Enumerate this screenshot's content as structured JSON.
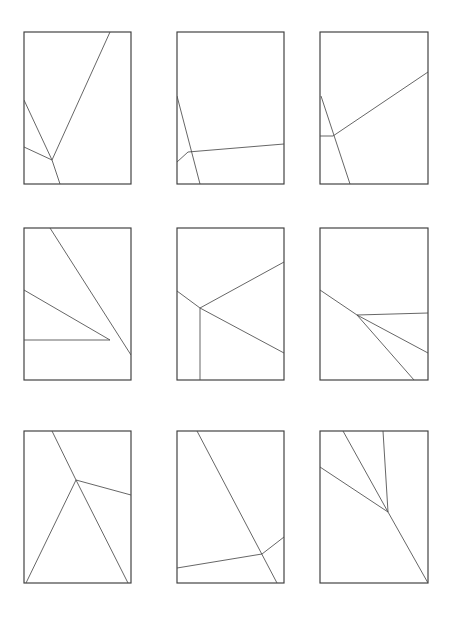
{
  "figure": {
    "canvas": {
      "width": 452,
      "height": 624,
      "background": "#ffffff"
    },
    "style": {
      "frame_color": "#3c3c3c",
      "frame_width": 1.15,
      "line_color": "#4a4a4a",
      "line_width": 0.85
    },
    "grid": {
      "rows": 3,
      "columns": 9
    }
  },
  "chart_data": {
    "type": "diagram",
    "subtitle": "",
    "xlabel": "",
    "ylabel": "",
    "grid": false,
    "legend": "none",
    "panel_count": 9,
    "panels": [
      {
        "id": "panel-1",
        "row": 1,
        "col": 1,
        "frame": {
          "x": 24,
          "y": 32,
          "width": 107,
          "height": 152
        },
        "segments": [
          {
            "name": "seg-1-a",
            "x1": 24,
            "y1": 100,
            "x2": 52,
            "y2": 160
          },
          {
            "name": "seg-1-b",
            "x1": 52,
            "y1": 160,
            "x2": 110,
            "y2": 32
          },
          {
            "name": "seg-1-c",
            "x1": 24,
            "y1": 147,
            "x2": 52,
            "y2": 160
          },
          {
            "name": "seg-1-d",
            "x1": 52,
            "y1": 160,
            "x2": 60,
            "y2": 184
          }
        ]
      },
      {
        "id": "panel-2",
        "row": 1,
        "col": 2,
        "frame": {
          "x": 177,
          "y": 32,
          "width": 107,
          "height": 152
        },
        "segments": [
          {
            "name": "seg-2-a",
            "x1": 177,
            "y1": 96,
            "x2": 200,
            "y2": 184
          },
          {
            "name": "seg-2-b",
            "x1": 177,
            "y1": 162,
            "x2": 188,
            "y2": 152
          },
          {
            "name": "seg-2-c",
            "x1": 188,
            "y1": 152,
            "x2": 284,
            "y2": 144
          }
        ]
      },
      {
        "id": "panel-3",
        "row": 1,
        "col": 3,
        "frame": {
          "x": 320,
          "y": 32,
          "width": 108,
          "height": 152
        },
        "segments": [
          {
            "name": "seg-3-a",
            "x1": 321,
            "y1": 96,
            "x2": 350,
            "y2": 184
          },
          {
            "name": "seg-3-b",
            "x1": 320,
            "y1": 136,
            "x2": 333,
            "y2": 136
          },
          {
            "name": "seg-3-c",
            "x1": 333,
            "y1": 136,
            "x2": 428,
            "y2": 72
          }
        ]
      },
      {
        "id": "panel-4",
        "row": 2,
        "col": 1,
        "frame": {
          "x": 24,
          "y": 228,
          "width": 107,
          "height": 152
        },
        "segments": [
          {
            "name": "seg-4-a",
            "x1": 50,
            "y1": 228,
            "x2": 131,
            "y2": 355
          },
          {
            "name": "seg-4-b",
            "x1": 24,
            "y1": 290,
            "x2": 110,
            "y2": 340
          },
          {
            "name": "seg-4-c",
            "x1": 24,
            "y1": 340,
            "x2": 110,
            "y2": 340
          }
        ]
      },
      {
        "id": "panel-5",
        "row": 2,
        "col": 2,
        "frame": {
          "x": 177,
          "y": 228,
          "width": 107,
          "height": 152
        },
        "segments": [
          {
            "name": "seg-5-a",
            "x1": 177,
            "y1": 291,
            "x2": 200,
            "y2": 308
          },
          {
            "name": "seg-5-b",
            "x1": 200,
            "y1": 308,
            "x2": 284,
            "y2": 262
          },
          {
            "name": "seg-5-c",
            "x1": 200,
            "y1": 308,
            "x2": 284,
            "y2": 353
          },
          {
            "name": "seg-5-d",
            "x1": 200,
            "y1": 308,
            "x2": 200,
            "y2": 380
          }
        ]
      },
      {
        "id": "panel-6",
        "row": 2,
        "col": 3,
        "frame": {
          "x": 320,
          "y": 228,
          "width": 108,
          "height": 152
        },
        "segments": [
          {
            "name": "seg-6-a",
            "x1": 320,
            "y1": 290,
            "x2": 357,
            "y2": 315
          },
          {
            "name": "seg-6-b",
            "x1": 357,
            "y1": 315,
            "x2": 428,
            "y2": 313
          },
          {
            "name": "seg-6-c",
            "x1": 357,
            "y1": 315,
            "x2": 428,
            "y2": 353
          },
          {
            "name": "seg-6-d",
            "x1": 357,
            "y1": 315,
            "x2": 414,
            "y2": 380
          }
        ]
      },
      {
        "id": "panel-7",
        "row": 3,
        "col": 1,
        "frame": {
          "x": 24,
          "y": 431,
          "width": 107,
          "height": 152
        },
        "segments": [
          {
            "name": "seg-7-a",
            "x1": 52,
            "y1": 431,
            "x2": 76,
            "y2": 480
          },
          {
            "name": "seg-7-b",
            "x1": 76,
            "y1": 480,
            "x2": 131,
            "y2": 495
          },
          {
            "name": "seg-7-c",
            "x1": 76,
            "y1": 480,
            "x2": 26,
            "y2": 583
          },
          {
            "name": "seg-7-d",
            "x1": 76,
            "y1": 480,
            "x2": 128,
            "y2": 583
          }
        ]
      },
      {
        "id": "panel-8",
        "row": 3,
        "col": 2,
        "frame": {
          "x": 177,
          "y": 431,
          "width": 107,
          "height": 152
        },
        "segments": [
          {
            "name": "seg-8-a",
            "x1": 197,
            "y1": 431,
            "x2": 277,
            "y2": 583
          },
          {
            "name": "seg-8-b",
            "x1": 177,
            "y1": 568,
            "x2": 262,
            "y2": 554
          },
          {
            "name": "seg-8-c",
            "x1": 262,
            "y1": 554,
            "x2": 284,
            "y2": 537
          }
        ]
      },
      {
        "id": "panel-9",
        "row": 3,
        "col": 3,
        "frame": {
          "x": 320,
          "y": 431,
          "width": 108,
          "height": 152
        },
        "segments": [
          {
            "name": "seg-9-a",
            "x1": 343,
            "y1": 431,
            "x2": 388,
            "y2": 512
          },
          {
            "name": "seg-9-b",
            "x1": 383,
            "y1": 431,
            "x2": 388,
            "y2": 512
          },
          {
            "name": "seg-9-c",
            "x1": 320,
            "y1": 467,
            "x2": 388,
            "y2": 512
          },
          {
            "name": "seg-9-d",
            "x1": 388,
            "y1": 512,
            "x2": 428,
            "y2": 583
          }
        ]
      }
    ]
  }
}
